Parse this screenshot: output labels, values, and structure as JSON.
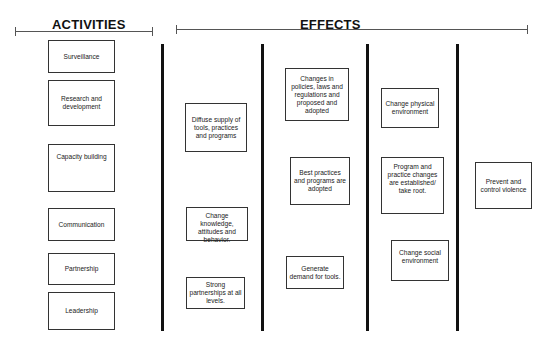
{
  "headers": {
    "activities": "ACTIVITIES",
    "effects": "EFFECTS"
  },
  "activities": [
    "Surveillance",
    "Research and development",
    "Capacity building",
    "Communication",
    "Partnership",
    "Leadership"
  ],
  "effects_column_1": [
    "Diffuse supply of tools, practices and programs",
    "Change knowledge, attitudes and behavior.",
    "Strong partnerships at all levels."
  ],
  "effects_column_2": [
    "Changes in policies, laws and regulations and proposed and adopted",
    "Best practices and programs are adopted",
    "Generate demand for tools."
  ],
  "effects_column_3": [
    "Change physical environment",
    "Program and practice changes are established/ take root.",
    "Change social environment"
  ],
  "outcome": "Prevent and control violence"
}
